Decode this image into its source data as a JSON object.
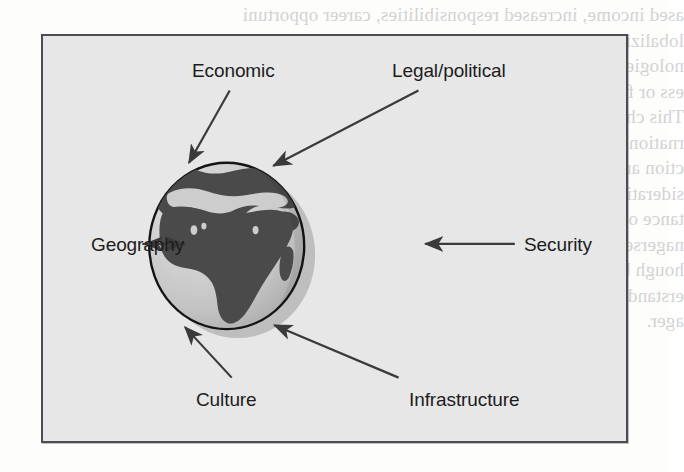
{
  "figure": {
    "type": "radial-diagram",
    "center_element": {
      "name": "earth-globe",
      "depicts": "Earth showing Africa, Europe and the Middle East",
      "sphere_fill": "#c9c9c9",
      "land_fill": "#4a4a4a",
      "outline_color": "#141414",
      "shadow_color": "#b4b4b4"
    },
    "frame": {
      "background": "#e7e7e7",
      "border_color": "#4c4c52"
    },
    "arrow_color": "#3a3a3a",
    "label_color": "#1c1c1c",
    "factors": [
      {
        "id": "economic",
        "label": "Economic",
        "position": "top-left",
        "arrow": "diagonal-down-right"
      },
      {
        "id": "legal-political",
        "label": "Legal/political",
        "position": "top-right",
        "arrow": "diagonal-down-left"
      },
      {
        "id": "geography",
        "label": "Geography",
        "position": "left",
        "arrow": "horizontal-right"
      },
      {
        "id": "security",
        "label": "Security",
        "position": "right",
        "arrow": "horizontal-left"
      },
      {
        "id": "culture",
        "label": "Culture",
        "position": "bottom-left",
        "arrow": "diagonal-up-right"
      },
      {
        "id": "infrastructure",
        "label": "Infrastructure",
        "position": "bottom-right",
        "arrow": "diagonal-up-left"
      }
    ]
  },
  "page_showthrough": {
    "note": "faint mirrored text bleeding through from the reverse side of the scanned page",
    "lines": [
      "ased income, increased responsibilities, career opportuni",
      "lobalizing trends place the international project manage",
      "nologies presents challenges in an unusual country envir",
      "ess or failure of a project.",
      "This chapter focuses on four major issues surrounding the",
      "rnational projects. First, the environmental factors that",
      "ction and implementation are briefly highlighted. Second",
      "siderations developed, and an illustrative cross-cultural",
      "tance of working in host country cultures is",
      "nagerses elect and train managers for international pro",
      "hough by no means conclusive, this chapter attempts",
      "erstanding of the major issues and challenges confronting",
      "ager."
    ]
  }
}
